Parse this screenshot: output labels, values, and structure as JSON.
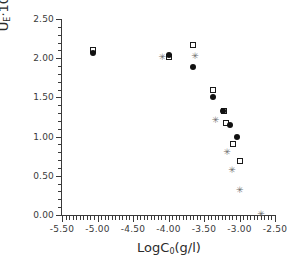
{
  "chart_data": {
    "type": "scatter",
    "title": "",
    "xlabel": "LogC₀(g/l)",
    "ylabel": "Uᴇ·10⁸(m²/Vs)",
    "xlim": [
      -5.5,
      -2.5
    ],
    "ylim": [
      0.0,
      2.5
    ],
    "xticks": [
      -5.5,
      -5.0,
      -4.5,
      -4.0,
      -3.5,
      -3.0,
      -2.5
    ],
    "yticks": [
      0.0,
      0.5,
      1.0,
      1.5,
      2.0,
      2.5
    ],
    "xtick_labels": [
      "-5.50",
      "-5.00",
      "-4.50",
      "-4.00",
      "-3.50",
      "-3.00",
      "-2.50"
    ],
    "ytick_labels": [
      "0.00",
      "0.50",
      "1.00",
      "1.50",
      "2.00",
      "2.50"
    ],
    "x_minor_tick_step": 0.05,
    "y_minor_tick_step": 0.1,
    "grid": false,
    "legend": null,
    "legend_position": "none",
    "series": [
      {
        "name": "open-square",
        "marker": "open_square",
        "color": "#1a1a1a",
        "points": [
          {
            "x": -5.06,
            "y": 2.1
          },
          {
            "x": -4.0,
            "y": 2.01
          },
          {
            "x": -3.65,
            "y": 2.17
          },
          {
            "x": -3.38,
            "y": 1.59
          },
          {
            "x": -3.22,
            "y": 1.33
          },
          {
            "x": -3.19,
            "y": 1.17
          },
          {
            "x": -3.09,
            "y": 0.91
          },
          {
            "x": -2.99,
            "y": 0.69
          }
        ]
      },
      {
        "name": "filled-circle",
        "marker": "filled_circle",
        "color": "#111111",
        "points": [
          {
            "x": -5.06,
            "y": 2.07
          },
          {
            "x": -4.0,
            "y": 2.04
          },
          {
            "x": -3.65,
            "y": 1.89
          },
          {
            "x": -3.37,
            "y": 1.51
          },
          {
            "x": -3.23,
            "y": 1.33
          },
          {
            "x": -3.14,
            "y": 1.15
          },
          {
            "x": -3.04,
            "y": 1.0
          }
        ]
      },
      {
        "name": "star",
        "marker": "star",
        "color": "#6e6e6e",
        "points": [
          {
            "x": -4.09,
            "y": 2.02
          },
          {
            "x": -3.63,
            "y": 2.03
          },
          {
            "x": -3.34,
            "y": 1.21
          },
          {
            "x": -3.18,
            "y": 0.8
          },
          {
            "x": -3.11,
            "y": 0.57
          },
          {
            "x": -3.0,
            "y": 0.32
          },
          {
            "x": -2.7,
            "y": 0.01
          }
        ]
      }
    ]
  }
}
